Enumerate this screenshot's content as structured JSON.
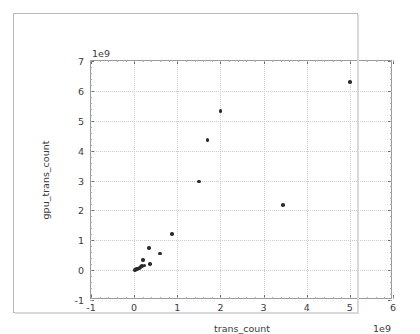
{
  "chart_data": {
    "type": "scatter",
    "title": "",
    "xlabel": "trans_count",
    "ylabel": "gpu_trans_count",
    "x_offset_text": "1e9",
    "y_offset_text": "1e9",
    "xlim": [
      -1,
      6
    ],
    "ylim": [
      -1,
      7
    ],
    "xticks": [
      -1,
      0,
      1,
      2,
      3,
      4,
      5,
      6
    ],
    "yticks": [
      -1,
      0,
      1,
      2,
      3,
      4,
      5,
      6,
      7
    ],
    "xticklabels": [
      "-1",
      "0",
      "1",
      "2",
      "3",
      "4",
      "5",
      "6"
    ],
    "yticklabels": [
      "-1",
      "0",
      "1",
      "2",
      "3",
      "4",
      "5",
      "6",
      "7"
    ],
    "grid": true,
    "legend": null,
    "marker_color": "#2b2b2b",
    "scale_note": "x and y values are in units of 1e9",
    "points": [
      {
        "x": 0.02,
        "y": 0.01
      },
      {
        "x": 0.04,
        "y": 0.02
      },
      {
        "x": 0.05,
        "y": 0.03
      },
      {
        "x": 0.07,
        "y": 0.04
      },
      {
        "x": 0.09,
        "y": 0.05
      },
      {
        "x": 0.11,
        "y": 0.06
      },
      {
        "x": 0.13,
        "y": 0.09
      },
      {
        "x": 0.15,
        "y": 0.12
      },
      {
        "x": 0.18,
        "y": 0.14
      },
      {
        "x": 0.2,
        "y": 0.33
      },
      {
        "x": 0.24,
        "y": 0.16
      },
      {
        "x": 0.35,
        "y": 0.75
      },
      {
        "x": 0.37,
        "y": 0.2
      },
      {
        "x": 0.6,
        "y": 0.55
      },
      {
        "x": 0.88,
        "y": 1.2
      },
      {
        "x": 1.5,
        "y": 2.97
      },
      {
        "x": 1.7,
        "y": 4.35
      },
      {
        "x": 2.0,
        "y": 5.33
      },
      {
        "x": 3.45,
        "y": 2.18
      },
      {
        "x": 5.0,
        "y": 6.3
      }
    ]
  }
}
